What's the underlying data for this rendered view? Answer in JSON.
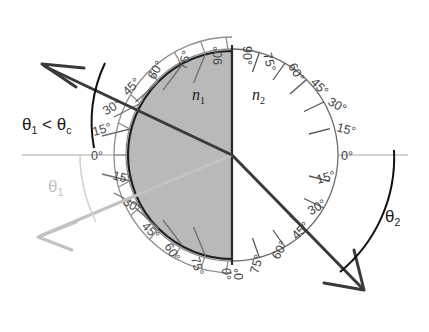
{
  "figure": {
    "type": "optics-refraction-protractor-diagram",
    "background_color": "#ffffff",
    "center": {
      "x": 232,
      "y": 155
    },
    "radius": 104,
    "media": {
      "left": {
        "symbol": "n",
        "subscript": "1",
        "fill_color": "#b9b9b9",
        "side": "left-half"
      },
      "right": {
        "symbol": "n",
        "subscript": "2",
        "fill_color": "#ffffff",
        "side": "right-half"
      }
    },
    "protractor": {
      "tick_interval_deg": 15,
      "left_scale_labels": [
        "0°",
        "15°",
        "30°",
        "45°",
        "60°",
        "75°",
        "90°",
        "75°",
        "60°",
        "45°",
        "30°",
        "15°",
        "0°"
      ],
      "right_scale_labels": [
        "0°",
        "15°",
        "30°",
        "45°",
        "60°",
        "75°",
        "90°",
        "75°",
        "60°",
        "45°",
        "30°",
        "15°",
        "0°"
      ],
      "left_labels_outside_ring": true,
      "right_labels_inside_circle": true,
      "zero_axis_label": "0°",
      "ninety_label": "90°"
    },
    "rays": {
      "incident": {
        "label": "θ1 < θc",
        "label_text": "θ",
        "label_sub_1": "1",
        "label_mid": " < θ",
        "label_sub_2": "c",
        "angle_from_normal_deg": 67,
        "angle_from_surface_deg": 23,
        "color": "#3a3a3a",
        "arrow_direction": "up-left",
        "arc_color": "#111111"
      },
      "reflected": {
        "label_text": "θ",
        "label_sub": "1",
        "angle_from_surface_deg": 23,
        "color": "#c2c2c2",
        "arrow_direction": "down-left",
        "arc_color": "#cccccc"
      },
      "refracted": {
        "label_text": "θ",
        "label_sub": "2",
        "angle_from_surface_deg": 45,
        "color": "#3a3a3a",
        "arrow_direction": "down-right",
        "arc_color": "#111111"
      }
    },
    "interface_line": {
      "orientation": "vertical",
      "color": "#2a2a2a"
    },
    "horizontal_axis": {
      "color": "#bdbdbd"
    }
  },
  "ticks_left": [
    {
      "deg": 0,
      "label": "0°"
    },
    {
      "deg": 15,
      "label": "15°"
    },
    {
      "deg": 30,
      "label": "30°"
    },
    {
      "deg": 45,
      "label": "45°"
    },
    {
      "deg": 60,
      "label": "60°"
    },
    {
      "deg": 75,
      "label": "75°"
    },
    {
      "deg": 90,
      "label": "90°"
    },
    {
      "deg": 105,
      "label": "75°"
    },
    {
      "deg": 120,
      "label": "60°"
    },
    {
      "deg": 135,
      "label": "45°"
    },
    {
      "deg": 150,
      "label": "30°"
    },
    {
      "deg": 165,
      "label": "15°"
    },
    {
      "deg": 180,
      "label": "0°"
    }
  ],
  "ticks_right": [
    {
      "deg": 0,
      "label": "0°"
    },
    {
      "deg": 15,
      "label": "15°"
    },
    {
      "deg": 30,
      "label": "30°"
    },
    {
      "deg": 45,
      "label": "45°"
    },
    {
      "deg": 60,
      "label": "60°"
    },
    {
      "deg": 75,
      "label": "75°"
    },
    {
      "deg": 90,
      "label": "90°"
    },
    {
      "deg": 105,
      "label": "75°"
    },
    {
      "deg": 120,
      "label": "60°"
    },
    {
      "deg": 135,
      "label": "45°"
    },
    {
      "deg": 150,
      "label": "30°"
    },
    {
      "deg": 165,
      "label": "15°"
    },
    {
      "deg": 180,
      "label": "0°"
    }
  ],
  "labels": {
    "n1": "n",
    "n1_sub": "1",
    "n2": "n",
    "n2_sub": "2",
    "theta": "θ",
    "lt": " < ",
    "sub_1": "1",
    "sub_2": "2",
    "sub_c": "c"
  }
}
